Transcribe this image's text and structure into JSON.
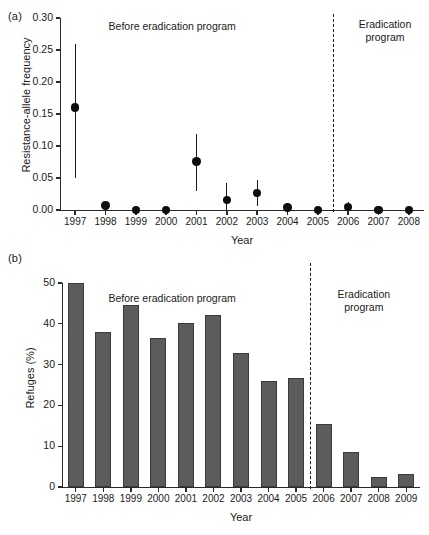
{
  "figure": {
    "panel_a_letter": "(a)",
    "panel_b_letter": "(b)"
  },
  "chart_data": [
    {
      "type": "scatter",
      "panel": "(a)",
      "title": "",
      "xlabel": "Year",
      "ylabel": "Resistance-allele frequency",
      "ylim": [
        0.0,
        0.3
      ],
      "yticks": [
        "0.00",
        "0.05",
        "0.10",
        "0.15",
        "0.20",
        "0.25",
        "0.30"
      ],
      "ytick_values": [
        0.0,
        0.05,
        0.1,
        0.15,
        0.2,
        0.25,
        0.3
      ],
      "grid": false,
      "legend": "none",
      "categories": [
        "1997",
        "1998",
        "1999",
        "2000",
        "2001",
        "2002",
        "2003",
        "2004",
        "2005",
        "2006",
        "2007",
        "2008"
      ],
      "values": [
        0.16,
        0.007,
        0.0,
        0.0,
        0.076,
        0.016,
        0.027,
        0.004,
        0.0,
        0.005,
        0.0,
        0.0
      ],
      "error_low": [
        0.05,
        0.0,
        0.0,
        0.0,
        0.03,
        0.0,
        0.006,
        0.0,
        0.0,
        0.0,
        0.0,
        0.0
      ],
      "error_high": [
        0.26,
        0.014,
        0.0,
        0.0,
        0.118,
        0.042,
        0.047,
        0.01,
        0.0,
        0.012,
        0.0,
        0.0
      ],
      "annotations": [
        {
          "text": "Before eradication program",
          "x_center_year": 2000.5
        },
        {
          "text": "Eradication",
          "x_center_year": 2007.0
        },
        {
          "text": "program",
          "x_center_year": 2007.0
        }
      ],
      "divider": {
        "between": "2005-2006",
        "style": "dashed"
      }
    },
    {
      "type": "bar",
      "panel": "(b)",
      "title": "",
      "xlabel": "Year",
      "ylabel": "Refuges (%)",
      "ylim": [
        0,
        50
      ],
      "yticks": [
        "0",
        "10",
        "20",
        "30",
        "40",
        "50"
      ],
      "ytick_values": [
        0,
        10,
        20,
        30,
        40,
        50
      ],
      "grid": false,
      "legend": "none",
      "categories": [
        "1997",
        "1998",
        "1999",
        "2000",
        "2001",
        "2002",
        "2003",
        "2004",
        "2005",
        "2006",
        "2007",
        "2008",
        "2009"
      ],
      "values": [
        50.0,
        38.0,
        44.5,
        36.5,
        40.2,
        42.2,
        32.8,
        26.0,
        26.6,
        15.5,
        8.5,
        2.5,
        3.2
      ],
      "annotations": [
        {
          "text": "Before eradication program",
          "x_center_year": 2000.5
        },
        {
          "text": "Eradication",
          "x_center_year": 2007.3
        },
        {
          "text": "program",
          "x_center_year": 2007.3
        }
      ],
      "divider": {
        "between": "2005-2006",
        "style": "dashed"
      },
      "bar_color": "#5c5c5c",
      "bar_edge_color": "#3a3a3a"
    }
  ],
  "panel_a": {
    "letter": "(a)",
    "ylabel": "Resistance-allele frequency",
    "xlabel": "Year",
    "annotation_before": "Before eradication program",
    "annotation_erad_line1": "Eradication",
    "annotation_erad_line2": "program",
    "yticks": [
      "0.30",
      "0.25",
      "0.20",
      "0.15",
      "0.10",
      "0.05",
      "0.00"
    ],
    "xticks": [
      "1997",
      "1998",
      "1999",
      "2000",
      "2001",
      "2002",
      "2003",
      "2004",
      "2005",
      "2006",
      "2007",
      "2008"
    ]
  },
  "panel_b": {
    "letter": "(b)",
    "ylabel": "Refuges (%)",
    "xlabel": "Year",
    "annotation_before": "Before eradication program",
    "annotation_erad_line1": "Eradication",
    "annotation_erad_line2": "program",
    "yticks": [
      "50",
      "40",
      "30",
      "20",
      "10",
      "0"
    ],
    "xticks": [
      "1997",
      "1998",
      "1999",
      "2000",
      "2001",
      "2002",
      "2003",
      "2004",
      "2005",
      "2006",
      "2007",
      "2008",
      "2009"
    ]
  }
}
